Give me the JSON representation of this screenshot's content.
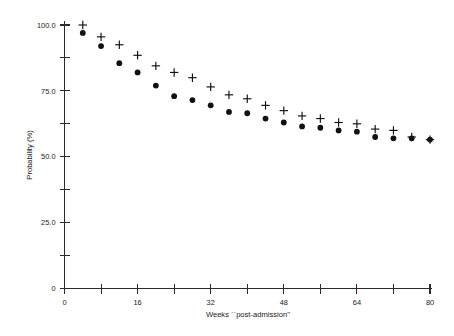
{
  "chart_data": {
    "type": "scatter",
    "title": "",
    "subtitle": "",
    "xlabel": "Weeks ``post-admission''",
    "ylabel": "Probability (%)",
    "xlim": [
      0,
      80
    ],
    "ylim": [
      0,
      100
    ],
    "grid": false,
    "legend_position": "none",
    "x_major_ticks": [
      0,
      16,
      32,
      48,
      64,
      80
    ],
    "x_minor_ticks": [
      8,
      24,
      40,
      56,
      72
    ],
    "x_tick_labels": [
      "0",
      "16",
      "32",
      "48",
      "64",
      "80"
    ],
    "y_major_ticks": [
      0,
      25,
      50,
      75,
      100
    ],
    "y_minor_ticks": [
      12.5,
      37.5,
      62.5,
      87.5
    ],
    "y_tick_labels": [
      "0",
      "25.0",
      "50.0",
      "75.0",
      "100.0"
    ],
    "x": [
      4,
      8,
      12,
      16,
      20,
      24,
      28,
      32,
      36,
      40,
      44,
      48,
      52,
      56,
      60,
      64,
      68,
      72,
      76,
      80
    ],
    "series": [
      {
        "name": "upper-estimate",
        "marker": "plus",
        "color": "#111111",
        "values": [
          100.0,
          95.5,
          92.5,
          88.5,
          84.5,
          82.0,
          80.0,
          76.5,
          73.5,
          72.0,
          69.5,
          67.5,
          65.5,
          64.5,
          63.0,
          62.5,
          60.5,
          60.0,
          57.5,
          56.5
        ]
      },
      {
        "name": "lower-estimate",
        "marker": "circle",
        "color": "#111111",
        "values": [
          97.0,
          92.0,
          85.5,
          82.0,
          77.0,
          73.0,
          71.5,
          69.5,
          67.0,
          66.5,
          64.5,
          63.0,
          61.5,
          61.0,
          60.0,
          59.5,
          57.5,
          57.0,
          57.0,
          56.5
        ]
      }
    ],
    "annotations": []
  },
  "axes": {
    "y_axis_title": "Probability (%)",
    "x_axis_title": "Weeks ``post-admission''"
  }
}
